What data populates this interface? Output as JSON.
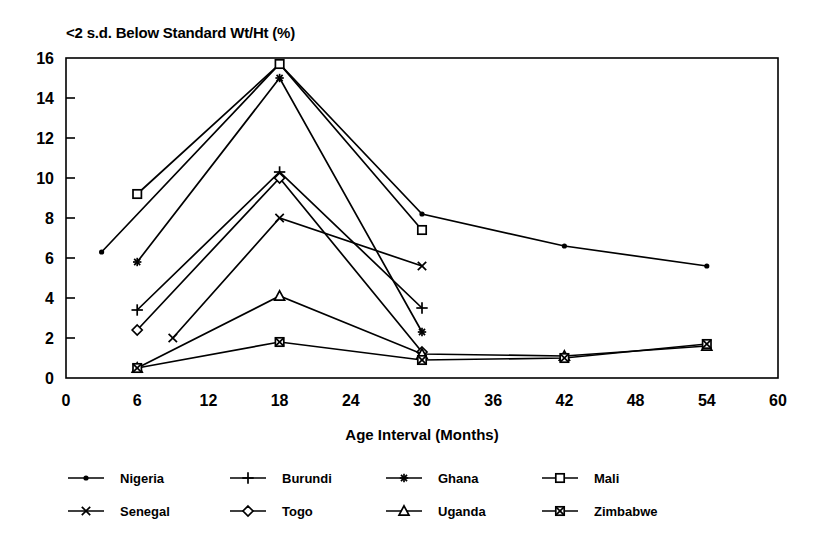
{
  "chart_data": {
    "type": "line",
    "title": "<2 s.d. Below Standard Wt/Ht (%)",
    "xlabel": "Age Interval (Months)",
    "ylabel": "",
    "xlim": [
      0,
      60
    ],
    "ylim": [
      0,
      16
    ],
    "xticks": [
      0,
      6,
      12,
      18,
      24,
      30,
      36,
      42,
      48,
      54,
      60
    ],
    "yticks": [
      0,
      2,
      4,
      6,
      8,
      10,
      12,
      14,
      16
    ],
    "grid": false,
    "legend_position": "bottom",
    "color": "#000000",
    "series": [
      {
        "name": "Nigeria",
        "marker": "dot",
        "x": [
          3,
          18,
          30,
          42,
          54
        ],
        "y": [
          6.3,
          15.7,
          8.2,
          6.6,
          5.6
        ]
      },
      {
        "name": "Burundi",
        "marker": "plus",
        "x": [
          6,
          18,
          30
        ],
        "y": [
          3.4,
          10.3,
          3.5
        ]
      },
      {
        "name": "Ghana",
        "marker": "asterisk",
        "x": [
          6,
          18,
          30
        ],
        "y": [
          5.8,
          15.0,
          2.3
        ]
      },
      {
        "name": "Mali",
        "marker": "square",
        "x": [
          6,
          18,
          30
        ],
        "y": [
          9.2,
          15.7,
          7.4
        ]
      },
      {
        "name": "Senegal",
        "marker": "cross",
        "x": [
          9,
          18,
          30
        ],
        "y": [
          2.0,
          8.0,
          5.6
        ]
      },
      {
        "name": "Togo",
        "marker": "diamond",
        "x": [
          6,
          18,
          30
        ],
        "y": [
          2.4,
          10.0,
          1.3
        ]
      },
      {
        "name": "Uganda",
        "marker": "triangle",
        "x": [
          6,
          18,
          30,
          42,
          54
        ],
        "y": [
          0.5,
          4.1,
          1.2,
          1.1,
          1.6
        ]
      },
      {
        "name": "Zimbabwe",
        "marker": "xsquare",
        "x": [
          6,
          18,
          30,
          42,
          54
        ],
        "y": [
          0.5,
          1.8,
          0.9,
          1.0,
          1.7
        ]
      }
    ]
  },
  "legend": {
    "entries": [
      {
        "label": "Nigeria",
        "marker": "dot"
      },
      {
        "label": "Burundi",
        "marker": "plus"
      },
      {
        "label": "Ghana",
        "marker": "asterisk"
      },
      {
        "label": "Mali",
        "marker": "square"
      },
      {
        "label": "Senegal",
        "marker": "cross"
      },
      {
        "label": "Togo",
        "marker": "diamond"
      },
      {
        "label": "Uganda",
        "marker": "triangle"
      },
      {
        "label": "Zimbabwe",
        "marker": "xsquare"
      }
    ]
  }
}
